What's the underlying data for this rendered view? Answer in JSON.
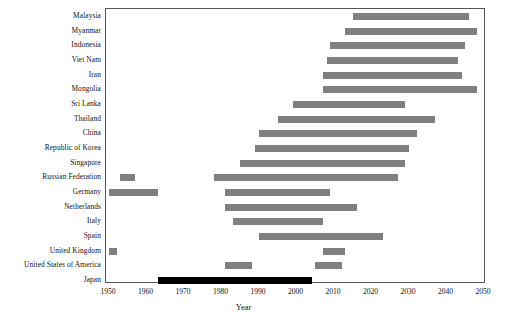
{
  "chart_data": {
    "type": "bar",
    "orientation": "horizontal",
    "subtype": "gantt-range",
    "title": "",
    "xlabel": "Year",
    "ylabel": "",
    "xlim": [
      1950,
      2050
    ],
    "xticks": [
      1950,
      1960,
      1970,
      1980,
      1990,
      2000,
      2010,
      2020,
      2030,
      2040,
      2050
    ],
    "grid": false,
    "legend": "none",
    "colors": {
      "bar": "#808080",
      "highlight": "#000000",
      "axis": "#555555",
      "text": "#111111",
      "background": "#ffffff"
    },
    "categories": [
      "Malaysia",
      "Myanmar",
      "Indonesia",
      "Viet Nam",
      "Iran",
      "Mongolia",
      "Sri Lanka",
      "Thailand",
      "China",
      "Republic of Korea",
      "Singapore",
      "Russian Federation",
      "Germany",
      "Netherlands",
      "Italy",
      "Spain",
      "United Kingdom",
      "United States of America",
      "Japan"
    ],
    "series": [
      {
        "name": "Malaysia",
        "highlight": false,
        "ranges": [
          {
            "start": 2015,
            "end": 2046
          }
        ]
      },
      {
        "name": "Myanmar",
        "highlight": false,
        "ranges": [
          {
            "start": 2013,
            "end": 2048
          }
        ]
      },
      {
        "name": "Indonesia",
        "highlight": false,
        "ranges": [
          {
            "start": 2009,
            "end": 2045
          }
        ]
      },
      {
        "name": "Viet Nam",
        "highlight": false,
        "ranges": [
          {
            "start": 2008,
            "end": 2043
          }
        ]
      },
      {
        "name": "Iran",
        "highlight": false,
        "ranges": [
          {
            "start": 2007,
            "end": 2044
          }
        ]
      },
      {
        "name": "Mongolia",
        "highlight": false,
        "ranges": [
          {
            "start": 2007,
            "end": 2048
          }
        ]
      },
      {
        "name": "Sri Lanka",
        "highlight": false,
        "ranges": [
          {
            "start": 1999,
            "end": 2029
          }
        ]
      },
      {
        "name": "Thailand",
        "highlight": false,
        "ranges": [
          {
            "start": 1995,
            "end": 2037
          }
        ]
      },
      {
        "name": "China",
        "highlight": false,
        "ranges": [
          {
            "start": 1990,
            "end": 2032
          }
        ]
      },
      {
        "name": "Republic of Korea",
        "highlight": false,
        "ranges": [
          {
            "start": 1989,
            "end": 2030
          }
        ]
      },
      {
        "name": "Singapore",
        "highlight": false,
        "ranges": [
          {
            "start": 1985,
            "end": 2029
          }
        ]
      },
      {
        "name": "Russian Federation",
        "highlight": false,
        "ranges": [
          {
            "start": 1953,
            "end": 1957
          },
          {
            "start": 1978,
            "end": 2027
          }
        ]
      },
      {
        "name": "Germany",
        "highlight": false,
        "ranges": [
          {
            "start": 1950,
            "end": 1963
          },
          {
            "start": 1981,
            "end": 2009
          }
        ]
      },
      {
        "name": "Netherlands",
        "highlight": false,
        "ranges": [
          {
            "start": 1981,
            "end": 2016
          }
        ]
      },
      {
        "name": "Italy",
        "highlight": false,
        "ranges": [
          {
            "start": 1983,
            "end": 2007
          }
        ]
      },
      {
        "name": "Spain",
        "highlight": false,
        "ranges": [
          {
            "start": 1990,
            "end": 2023
          }
        ]
      },
      {
        "name": "United Kingdom",
        "highlight": false,
        "ranges": [
          {
            "start": 1950,
            "end": 1952
          },
          {
            "start": 2007,
            "end": 2013
          }
        ]
      },
      {
        "name": "United States of America",
        "highlight": false,
        "ranges": [
          {
            "start": 1981,
            "end": 1988
          },
          {
            "start": 2005,
            "end": 2012
          }
        ]
      },
      {
        "name": "Japan",
        "highlight": true,
        "ranges": [
          {
            "start": 1963,
            "end": 2004
          }
        ]
      }
    ]
  }
}
